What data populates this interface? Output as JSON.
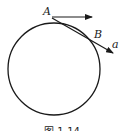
{
  "diagram": {
    "labels": {
      "point_a": "A",
      "point_b": "B",
      "acceleration": "a"
    },
    "caption": "图 1-14",
    "colors": {
      "stroke": "#1a1a1a",
      "background": "#ffffff"
    }
  }
}
